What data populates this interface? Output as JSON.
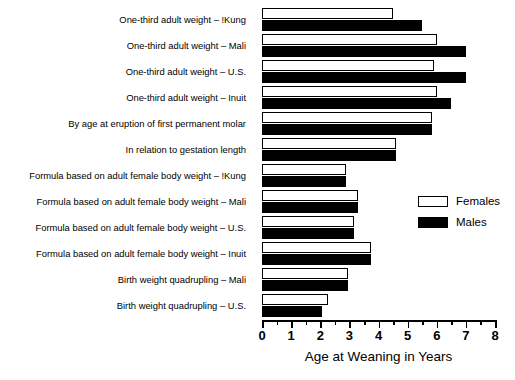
{
  "chart_data": {
    "type": "bar",
    "orientation": "horizontal",
    "title": "",
    "xlabel": "Age at Weaning in Years",
    "ylabel": "",
    "xlim": [
      0,
      8
    ],
    "xticks": [
      0,
      1,
      2,
      3,
      4,
      5,
      6,
      7,
      8
    ],
    "xtick_labels": [
      "0",
      "1",
      "2",
      "3",
      "4",
      "5",
      "6",
      "7",
      "8"
    ],
    "minor_tick_interval": 0.5,
    "grid": false,
    "legend_position": "right-middle",
    "categories": [
      "One-third adult weight – !Kung",
      "One-third adult weight – Mali",
      "One-third adult weight – U.S.",
      "One-third adult weight – Inuit",
      "By age at eruption of first permanent molar",
      "In relation to gestation length",
      "Formula based on adult female body weight – !Kung",
      "Formula based on adult female body weight – Mali",
      "Formula based on adult female body weight – U.S.",
      "Formula based on adult female body weight – Inuit",
      "Birth weight quadrupling – Mali",
      "Birth weight quadrupling – U.S."
    ],
    "series": [
      {
        "name": "Females",
        "color": "#ffffff",
        "edge_color": "#000000",
        "values": [
          4.5,
          6.0,
          5.9,
          6.0,
          5.85,
          4.6,
          2.9,
          3.3,
          3.15,
          3.75,
          2.95,
          2.25
        ]
      },
      {
        "name": "Males",
        "color": "#000000",
        "edge_color": "#000000",
        "values": [
          5.5,
          7.0,
          7.0,
          6.5,
          5.85,
          4.6,
          2.9,
          3.3,
          3.15,
          3.75,
          2.95,
          2.05
        ]
      }
    ]
  },
  "legend": {
    "items": [
      {
        "label": "Females",
        "style": "female"
      },
      {
        "label": "Males",
        "style": "male"
      }
    ]
  }
}
